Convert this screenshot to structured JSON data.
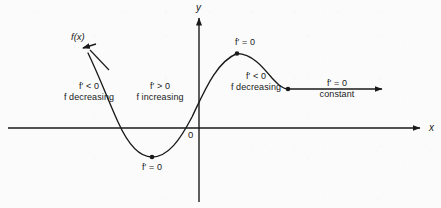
{
  "figure": {
    "kind": "calculus-derivative-sign-diagram",
    "background_color": "#fbfbfb",
    "ink_color": "#1a1a1a"
  },
  "axes": {
    "x_label": "x",
    "y_label": "y",
    "origin_label": "0",
    "x_axis": {
      "y_px": 128,
      "x_start_px": 8,
      "x_end_px": 424,
      "arrow": "right"
    },
    "y_axis": {
      "x_px": 199,
      "y_top_px": 14,
      "y_bottom_px": 202,
      "arrow": "up"
    }
  },
  "curve": {
    "name": "f(x)",
    "label": "f(x)",
    "label_arrow": "points up-left to the left branch of the curve",
    "stroke_color": "#1a1a1a",
    "key_points": [
      {
        "id": "left-arrow-tip",
        "x_px": 83,
        "y_px": 48,
        "type": "arrowhead"
      },
      {
        "id": "left-x-intercept",
        "x_px": 117,
        "y_px": 128,
        "type": "crossing"
      },
      {
        "id": "local-min",
        "x_px": 152,
        "y_px": 157,
        "type": "dot"
      },
      {
        "id": "middle-x-intercept",
        "x_px": 185,
        "y_px": 128,
        "type": "crossing"
      },
      {
        "id": "y-intercept",
        "x_px": 199,
        "y_px": 92,
        "type": "crossing"
      },
      {
        "id": "local-max",
        "x_px": 237,
        "y_px": 53,
        "type": "dot"
      },
      {
        "id": "inflection-to-flat",
        "x_px": 288,
        "y_px": 89,
        "type": "dot"
      },
      {
        "id": "right-arrow-tip",
        "x_px": 386,
        "y_px": 89,
        "type": "arrowhead"
      }
    ]
  },
  "annotations": [
    {
      "id": "left-branch",
      "derivative": "f′ < 0",
      "behavior": "f decreasing",
      "x_px": 89,
      "y_px": 81
    },
    {
      "id": "middle-branch",
      "derivative": "f′ > 0",
      "behavior": "f increasing",
      "x_px": 160,
      "y_px": 81
    },
    {
      "id": "right-branch",
      "derivative": "f′ < 0",
      "behavior": "f decreasing",
      "x_px": 256,
      "y_px": 71
    },
    {
      "id": "constant-branch",
      "derivative": "f′ = 0",
      "behavior": "constant",
      "x_px": 337,
      "y_px": 78
    }
  ],
  "critical_labels": [
    {
      "id": "max-critical-point",
      "text": "f′ = 0",
      "x_px": 245,
      "y_px": 37,
      "marks": "local maximum"
    },
    {
      "id": "min-critical-point",
      "text": "f′ = 0",
      "x_px": 152,
      "y_px": 162,
      "marks": "local minimum"
    }
  ]
}
